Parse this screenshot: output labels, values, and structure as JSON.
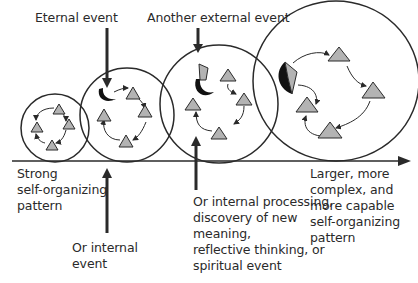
{
  "labels": {
    "external_event": "Eternal event",
    "another_external_event": "Another external event",
    "start_pattern": "Strong\nself-organizing\npattern",
    "internal_event": "Or internal\nevent",
    "internal_processing": "Or internal processing,\ndiscovery of new\nmeaning,\nreflective thinking, or\nspiritual event",
    "end_pattern": "Larger, more\ncomplex, and\nmore capable\nself-organizing\npattern"
  },
  "colors": {
    "line": "#2a2a2a",
    "triangle_fill": "#b3b3b3",
    "event_fill": "#111111"
  },
  "stages": [
    {
      "name": "stage-1",
      "triangles": 4
    },
    {
      "name": "stage-2",
      "triangles": 4,
      "event": "crescent"
    },
    {
      "name": "stage-3",
      "triangles": 4,
      "event": "crescent-with-diamond"
    },
    {
      "name": "stage-4",
      "triangles": 4,
      "event": "merged-half-diamond"
    }
  ]
}
